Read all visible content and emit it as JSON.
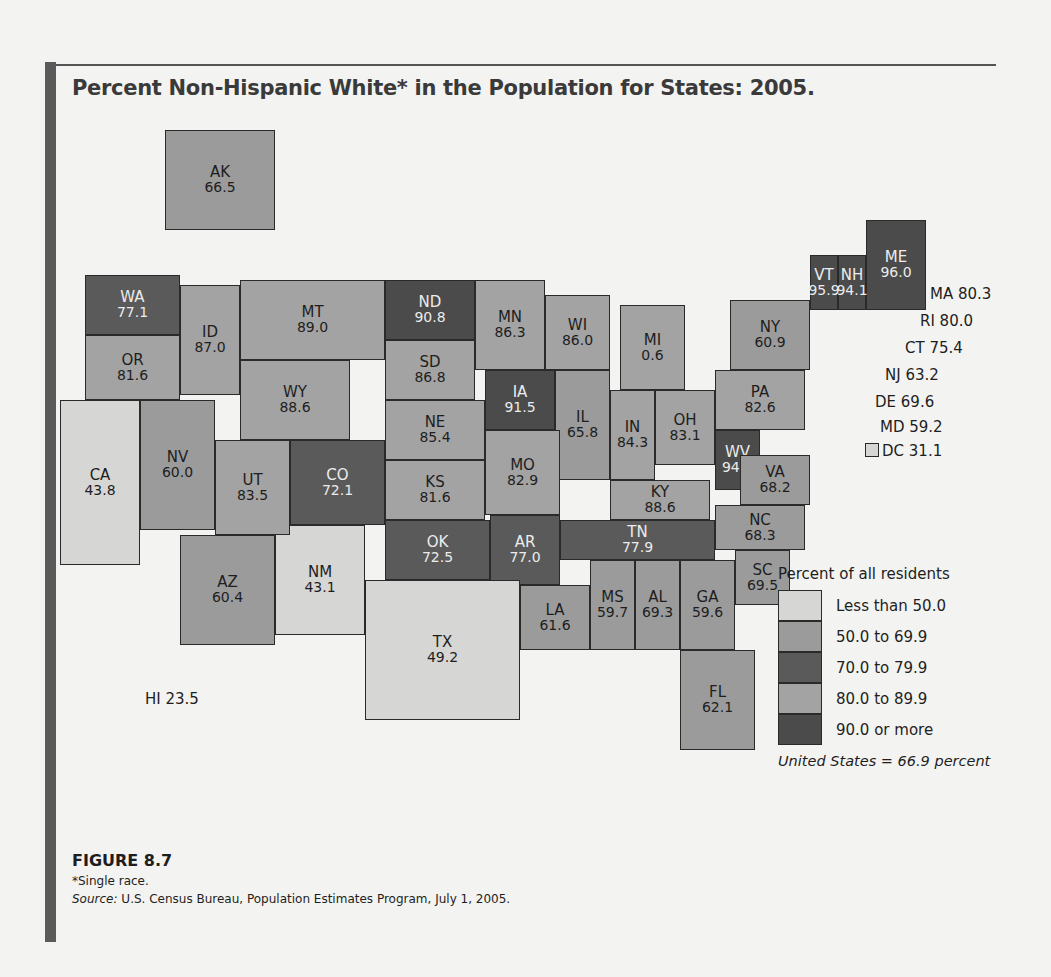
{
  "title": "Percent Non-Hispanic White* in the Population for States: 2005.",
  "figure_label": "FIGURE 8.7",
  "footnote": "*Single race.",
  "source_prefix": "Source:",
  "source_text": " U.S. Census Bureau, Population Estimates Program, July 1, 2005.",
  "legend": {
    "title": "Percent of all residents",
    "bins": [
      {
        "label": "Less than 50.0",
        "color": "#d6d6d4"
      },
      {
        "label": "50.0 to 69.9",
        "color": "#9b9b9b"
      },
      {
        "label": "70.0 to 79.9",
        "color": "#5a5a5a"
      },
      {
        "label": "80.0 to 89.9",
        "color": "#a3a3a3"
      },
      {
        "label": "90.0 or more",
        "color": "#4b4b4b"
      }
    ],
    "note": "United States = 66.9 percent"
  },
  "callouts": {
    "ma": "MA 80.3",
    "ri": "RI 80.0",
    "ct": "CT 75.4",
    "nj": "NJ 63.2",
    "de": "DE 69.6",
    "md": "MD 59.2",
    "dc": "DC 31.1",
    "hi": "HI 23.5"
  },
  "chart_data": {
    "type": "choropleth",
    "title": "Percent Non-Hispanic White* in the Population for States: 2005.",
    "units": "percent of all residents",
    "national_value": 66.9,
    "bins": [
      {
        "label": "Less than 50.0",
        "min": null,
        "max": 49.9
      },
      {
        "label": "50.0 to 69.9",
        "min": 50.0,
        "max": 69.9
      },
      {
        "label": "70.0 to 79.9",
        "min": 70.0,
        "max": 79.9
      },
      {
        "label": "80.0 to 89.9",
        "min": 80.0,
        "max": 89.9
      },
      {
        "label": "90.0 or more",
        "min": 90.0,
        "max": null
      }
    ],
    "states": {
      "AK": 66.5,
      "WA": 77.1,
      "OR": 81.6,
      "CA": 43.8,
      "ID": 87.0,
      "NV": 60.0,
      "MT": 89.0,
      "WY": 88.6,
      "UT": 83.5,
      "AZ": 60.4,
      "CO": 72.1,
      "NM": 43.1,
      "ND": 90.8,
      "SD": 86.8,
      "NE": 85.4,
      "KS": 81.6,
      "OK": 72.5,
      "TX": 49.2,
      "MN": 86.3,
      "IA": 91.5,
      "MO": 82.9,
      "AR": 77.0,
      "LA": 61.6,
      "WI": 86.0,
      "IL": 65.8,
      "MI": 0.6,
      "IN": 84.3,
      "OH": 83.1,
      "KY": 88.6,
      "TN": 77.9,
      "MS": 59.7,
      "AL": 69.3,
      "GA": 59.6,
      "FL": 62.1,
      "SC": 69.5,
      "NC": 68.3,
      "VA": 68.2,
      "WV": 94.4,
      "PA": 82.6,
      "NY": 60.9,
      "VT": 95.9,
      "NH": 94.1,
      "ME": 96.0,
      "MA": 80.3,
      "RI": 80.0,
      "CT": 75.4,
      "NJ": 63.2,
      "DE": 69.6,
      "MD": 59.2,
      "DC": 31.1,
      "HI": 23.5
    }
  },
  "tiles": [
    {
      "ab": "AK",
      "val": "66.5",
      "bin": 1,
      "x": 105,
      "y": 0,
      "w": 110,
      "h": 100
    },
    {
      "ab": "WA",
      "val": "77.1",
      "bin": 2,
      "x": 25,
      "y": 145,
      "w": 95,
      "h": 60
    },
    {
      "ab": "OR",
      "val": "81.6",
      "bin": 3,
      "x": 25,
      "y": 205,
      "w": 95,
      "h": 65
    },
    {
      "ab": "CA",
      "val": "43.8",
      "bin": 0,
      "x": 0,
      "y": 270,
      "w": 80,
      "h": 165
    },
    {
      "ab": "ID",
      "val": "87.0",
      "bin": 3,
      "x": 120,
      "y": 155,
      "w": 60,
      "h": 110
    },
    {
      "ab": "NV",
      "val": "60.0",
      "bin": 1,
      "x": 80,
      "y": 270,
      "w": 75,
      "h": 130
    },
    {
      "ab": "MT",
      "val": "89.0",
      "bin": 3,
      "x": 180,
      "y": 150,
      "w": 145,
      "h": 80
    },
    {
      "ab": "WY",
      "val": "88.6",
      "bin": 3,
      "x": 180,
      "y": 230,
      "w": 110,
      "h": 80
    },
    {
      "ab": "UT",
      "val": "83.5",
      "bin": 3,
      "x": 155,
      "y": 310,
      "w": 75,
      "h": 95
    },
    {
      "ab": "AZ",
      "val": "60.4",
      "bin": 1,
      "x": 120,
      "y": 405,
      "w": 95,
      "h": 110
    },
    {
      "ab": "CO",
      "val": "72.1",
      "bin": 2,
      "x": 230,
      "y": 310,
      "w": 95,
      "h": 85
    },
    {
      "ab": "NM",
      "val": "43.1",
      "bin": 0,
      "x": 215,
      "y": 395,
      "w": 90,
      "h": 110
    },
    {
      "ab": "ND",
      "val": "90.8",
      "bin": 4,
      "x": 325,
      "y": 150,
      "w": 90,
      "h": 60
    },
    {
      "ab": "SD",
      "val": "86.8",
      "bin": 3,
      "x": 325,
      "y": 210,
      "w": 90,
      "h": 60
    },
    {
      "ab": "NE",
      "val": "85.4",
      "bin": 3,
      "x": 325,
      "y": 270,
      "w": 100,
      "h": 60
    },
    {
      "ab": "KS",
      "val": "81.6",
      "bin": 3,
      "x": 325,
      "y": 330,
      "w": 100,
      "h": 60
    },
    {
      "ab": "OK",
      "val": "72.5",
      "bin": 2,
      "x": 325,
      "y": 390,
      "w": 105,
      "h": 60
    },
    {
      "ab": "TX",
      "val": "49.2",
      "bin": 0,
      "x": 305,
      "y": 450,
      "w": 155,
      "h": 140
    },
    {
      "ab": "MN",
      "val": "86.3",
      "bin": 3,
      "x": 415,
      "y": 150,
      "w": 70,
      "h": 90
    },
    {
      "ab": "IA",
      "val": "91.5",
      "bin": 4,
      "x": 425,
      "y": 240,
      "w": 70,
      "h": 60
    },
    {
      "ab": "MO",
      "val": "82.9",
      "bin": 3,
      "x": 425,
      "y": 300,
      "w": 75,
      "h": 85
    },
    {
      "ab": "AR",
      "val": "77.0",
      "bin": 2,
      "x": 430,
      "y": 385,
      "w": 70,
      "h": 70
    },
    {
      "ab": "LA",
      "val": "61.6",
      "bin": 1,
      "x": 460,
      "y": 455,
      "w": 70,
      "h": 65
    },
    {
      "ab": "WI",
      "val": "86.0",
      "bin": 3,
      "x": 485,
      "y": 165,
      "w": 65,
      "h": 75
    },
    {
      "ab": "IL",
      "val": "65.8",
      "bin": 1,
      "x": 495,
      "y": 240,
      "w": 55,
      "h": 110
    },
    {
      "ab": "MI",
      "val": "0.6",
      "bin": 3,
      "x": 560,
      "y": 175,
      "w": 65,
      "h": 85
    },
    {
      "ab": "IN",
      "val": "84.3",
      "bin": 3,
      "x": 550,
      "y": 260,
      "w": 45,
      "h": 90
    },
    {
      "ab": "OH",
      "val": "83.1",
      "bin": 3,
      "x": 595,
      "y": 260,
      "w": 60,
      "h": 75
    },
    {
      "ab": "KY",
      "val": "88.6",
      "bin": 3,
      "x": 550,
      "y": 350,
      "w": 100,
      "h": 40
    },
    {
      "ab": "TN",
      "val": "77.9",
      "bin": 2,
      "x": 500,
      "y": 390,
      "w": 155,
      "h": 40
    },
    {
      "ab": "MS",
      "val": "59.7",
      "bin": 1,
      "x": 530,
      "y": 430,
      "w": 45,
      "h": 90
    },
    {
      "ab": "AL",
      "val": "69.3",
      "bin": 1,
      "x": 575,
      "y": 430,
      "w": 45,
      "h": 90
    },
    {
      "ab": "GA",
      "val": "59.6",
      "bin": 1,
      "x": 620,
      "y": 430,
      "w": 55,
      "h": 90
    },
    {
      "ab": "FL",
      "val": "62.1",
      "bin": 1,
      "x": 620,
      "y": 520,
      "w": 75,
      "h": 100
    },
    {
      "ab": "SC",
      "val": "69.5",
      "bin": 1,
      "x": 675,
      "y": 420,
      "w": 55,
      "h": 55
    },
    {
      "ab": "NC",
      "val": "68.3",
      "bin": 1,
      "x": 655,
      "y": 375,
      "w": 90,
      "h": 45
    },
    {
      "ab": "VA",
      "val": "68.2",
      "bin": 1,
      "x": 680,
      "y": 325,
      "w": 70,
      "h": 50
    },
    {
      "ab": "WV",
      "val": "94.4",
      "bin": 4,
      "x": 655,
      "y": 300,
      "w": 45,
      "h": 60
    },
    {
      "ab": "PA",
      "val": "82.6",
      "bin": 3,
      "x": 655,
      "y": 240,
      "w": 90,
      "h": 60
    },
    {
      "ab": "NY",
      "val": "60.9",
      "bin": 1,
      "x": 670,
      "y": 170,
      "w": 80,
      "h": 70
    },
    {
      "ab": "VT",
      "val": "95.9",
      "bin": 4,
      "x": 750,
      "y": 125,
      "w": 28,
      "h": 55
    },
    {
      "ab": "NH",
      "val": "94.1",
      "bin": 4,
      "x": 778,
      "y": 125,
      "w": 28,
      "h": 55
    },
    {
      "ab": "ME",
      "val": "96.0",
      "bin": 4,
      "x": 806,
      "y": 90,
      "w": 60,
      "h": 90
    }
  ]
}
